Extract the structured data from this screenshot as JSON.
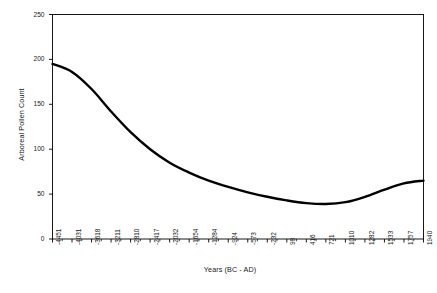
{
  "chart_data": {
    "type": "line",
    "title": "",
    "xlabel": "Years (BC - AD)",
    "ylabel": "Arboreal Pollen Count",
    "ylim": [
      0,
      250
    ],
    "ytick_labels": [
      "0",
      "50",
      "100",
      "150",
      "200",
      "250"
    ],
    "ytick_values": [
      0,
      50,
      100,
      150,
      200,
      250
    ],
    "grid": false,
    "legend": "none",
    "categories": [
      "-4451",
      "-4031",
      "-3618",
      "-3211",
      "-2810",
      "-2417",
      "-2032",
      "-1654",
      "-1284",
      "-924",
      "-573",
      "-232",
      "98",
      "416",
      "721",
      "1010",
      "1282",
      "1533",
      "1757",
      "1940"
    ],
    "values": [
      195,
      186,
      167,
      142,
      119,
      100,
      85,
      74,
      65,
      58,
      52,
      47,
      43,
      40,
      39,
      41,
      47,
      55,
      62,
      65
    ],
    "series": [
      {
        "name": "Arboreal Pollen Count",
        "color": "#000000",
        "values": [
          195,
          186,
          167,
          142,
          119,
          100,
          85,
          74,
          65,
          58,
          52,
          47,
          43,
          40,
          39,
          41,
          47,
          55,
          62,
          65
        ]
      }
    ]
  },
  "style": {
    "line_color": "#000000",
    "axis_color": "#000000",
    "background": "#ffffff"
  }
}
